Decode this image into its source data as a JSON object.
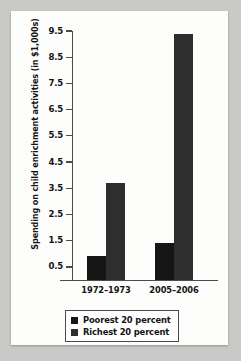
{
  "chart_data": {
    "type": "bar",
    "title": "",
    "xlabel": "",
    "ylabel": "Spending on child enrichment activities (in $1,000s)",
    "categories": [
      "1972–1973",
      "2005–2006"
    ],
    "series": [
      {
        "name": "Poorest 20 percent",
        "values": [
          0.9,
          1.4
        ],
        "color": "#161616"
      },
      {
        "name": "Richest 20 percent",
        "values": [
          3.7,
          9.4
        ],
        "color": "#2e2e2e"
      }
    ],
    "ylim": [
      0,
      9.5
    ],
    "yticks": [
      0.5,
      1.5,
      2.5,
      3.5,
      4.5,
      5.5,
      6.5,
      7.5,
      8.5,
      9.5
    ],
    "ytick_labels": [
      "0.5",
      "1.5",
      "2.5",
      "3.5",
      "4.5",
      "5.5",
      "6.5",
      "7.5",
      "8.5",
      "9.5"
    ],
    "grid": false,
    "legend_position": "bottom"
  },
  "legend": {
    "items": [
      {
        "label": "Poorest 20 percent",
        "color": "#161616"
      },
      {
        "label": "Richest 20 percent",
        "color": "#2e2e2e"
      }
    ]
  },
  "colors": {
    "page_background": "#c9c9c7",
    "panel_background": "#fdfdfc",
    "axis": "#4c4c4c",
    "text": "#141414"
  }
}
